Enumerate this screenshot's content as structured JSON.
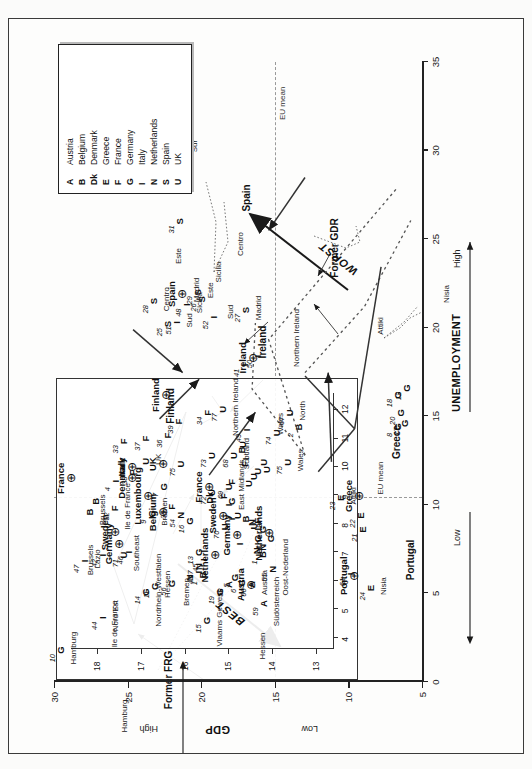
{
  "figure": {
    "title_hidden": "",
    "orientation": "rotated-90",
    "legend": {
      "name": "country-key",
      "entries": [
        {
          "key": "A",
          "label": "Austria"
        },
        {
          "key": "B",
          "label": "Belgium"
        },
        {
          "key": "Dk",
          "label": "Denmark"
        },
        {
          "key": "E",
          "label": "Greece"
        },
        {
          "key": "F",
          "label": "France"
        },
        {
          "key": "G",
          "label": "Germany"
        },
        {
          "key": "I",
          "label": "Italy"
        },
        {
          "key": "N",
          "label": "Netherlands"
        },
        {
          "key": "S",
          "label": "Spain"
        },
        {
          "key": "U",
          "label": "UK"
        }
      ]
    },
    "axes": {
      "x_title": "UNEMPLOYMENT",
      "x_low": "Low",
      "x_high": "High",
      "x_ticks": [
        "0",
        "5",
        "10",
        "15",
        "20",
        "25",
        "30",
        "35"
      ],
      "y_title": "GDP",
      "y_low": "Low",
      "y_high": "High",
      "y_ticks": [
        "5",
        "10",
        "15",
        "20",
        "25",
        "30"
      ],
      "eu_mean_label": "EU mean"
    },
    "annotations": {
      "best": "BEST",
      "worst": "WORST"
    },
    "inset": {
      "x_ticks": [
        "4",
        "5",
        "6",
        "7",
        "8",
        "9",
        "10",
        "11",
        "12"
      ],
      "y_ticks": [
        "13",
        "14",
        "15",
        "16",
        "17",
        "18"
      ]
    },
    "country_group_labels": [
      "Luxembourg",
      "Sweden",
      "Germany",
      "Austria",
      "Netherlands",
      "France",
      "Finland",
      "Greece",
      "Portugal",
      "Spain",
      "Ireland",
      "Former GDR",
      "Former FRG",
      "Denmark",
      "Belgium",
      "Italy",
      "UK"
    ],
    "region_labels": [
      "Hamburg",
      "Ile de France",
      "Brussels",
      "Bremen",
      "Hessen",
      "Wales",
      "Attiki",
      "Nisia",
      "Northern Ireland",
      "Sud",
      "Sicilia",
      "Centro",
      "Sur",
      "Este",
      "Madrid",
      "Nord Est",
      "Nordrhein-Westfalen",
      "Vlaams Gewest",
      "Oost-Nederland",
      "Südösterreich",
      "East Midlands",
      "Scotland",
      "Southeast",
      "England and Scotland",
      "North",
      "Lazio"
    ]
  },
  "chart_data": {
    "type": "scatter",
    "title": "",
    "xlabel": "UNEMPLOYMENT",
    "ylabel": "GDP",
    "xlim": [
      0,
      35
    ],
    "ylim": [
      5,
      30
    ],
    "grid": false,
    "legend_position": "top-right",
    "eu_mean_x": 10.4,
    "eu_mean_y": 15.0,
    "main_points": [
      {
        "key": "G",
        "id": "10",
        "x": 1.8,
        "y": 29.6,
        "region": "Hamburg"
      },
      {
        "key": "B",
        "id": "",
        "x": 9.6,
        "y": 27.6,
        "region": "Brussels"
      },
      {
        "key": "B",
        "id": "",
        "x": 10.2,
        "y": 27.2,
        "region": ""
      },
      {
        "key": "F",
        "id": "32",
        "x": 9.8,
        "y": 25.9,
        "region": "Ile de France"
      },
      {
        "key": "G",
        "id": "9",
        "x": 9.5,
        "y": 23.4,
        "region": "Bremen"
      },
      {
        "key": "G",
        "id": "11",
        "x": 5.4,
        "y": 23.2,
        "region": "Hessen"
      },
      {
        "key": "ctr",
        "id": "Luxembourg",
        "x": 10.5,
        "y": 23.6,
        "region": "Luxembourg"
      },
      {
        "key": "I",
        "id": "43",
        "x": 6.2,
        "y": 20.2,
        "region": ""
      },
      {
        "key": "I",
        "id": "45",
        "x": 6.9,
        "y": 19.9,
        "region": ""
      },
      {
        "key": "A",
        "id": "58",
        "x": 5.5,
        "y": 18.2,
        "region": ""
      },
      {
        "key": "G",
        "id": "5",
        "x": 5.9,
        "y": 17.8,
        "region": ""
      },
      {
        "key": "G",
        "id": "6",
        "x": 5.6,
        "y": 17.3,
        "region": ""
      },
      {
        "key": "A",
        "id": "60",
        "x": 5.5,
        "y": 16.6,
        "region": "Austria"
      },
      {
        "key": "I",
        "id": "",
        "x": 7.8,
        "y": 17.4,
        "region": ""
      },
      {
        "key": "N",
        "id": "",
        "x": 7.4,
        "y": 16.3,
        "region": ""
      },
      {
        "key": "B",
        "id": "1",
        "x": 7.2,
        "y": 15.9,
        "region": ""
      },
      {
        "key": "N",
        "id": "",
        "x": 7.6,
        "y": 15.9,
        "region": ""
      },
      {
        "key": "G",
        "id": "",
        "x": 8.1,
        "y": 16.2,
        "region": ""
      },
      {
        "key": "G",
        "id": "",
        "x": 8.6,
        "y": 15.9,
        "region": ""
      },
      {
        "key": "G",
        "id": "",
        "x": 8.1,
        "y": 15.3,
        "region": ""
      },
      {
        "key": "U",
        "id": "",
        "x": 8.8,
        "y": 16.5,
        "region": ""
      },
      {
        "key": "U",
        "id": "",
        "x": 9.4,
        "y": 17.6,
        "region": ""
      },
      {
        "key": "I",
        "id": "",
        "x": 9.2,
        "y": 18.0,
        "region": ""
      },
      {
        "key": "Dk",
        "id": "",
        "x": 10.4,
        "y": 19.5,
        "region": ""
      },
      {
        "key": "F",
        "id": "",
        "x": 10.5,
        "y": 18.5,
        "region": ""
      },
      {
        "key": "G",
        "id": "",
        "x": 10.2,
        "y": 18.0,
        "region": ""
      },
      {
        "key": "I",
        "id": "",
        "x": 10.0,
        "y": 18.2,
        "region": ""
      },
      {
        "key": "B",
        "id": "",
        "x": 9.2,
        "y": 17.0,
        "region": ""
      },
      {
        "key": "N",
        "id": "",
        "x": 9.0,
        "y": 16.6,
        "region": ""
      },
      {
        "key": "F",
        "id": "",
        "x": 9.1,
        "y": 16.2,
        "region": ""
      },
      {
        "key": "F",
        "id": "",
        "x": 11.3,
        "y": 18.0,
        "region": ""
      },
      {
        "key": "U",
        "id": "",
        "x": 11.2,
        "y": 16.8,
        "region": ""
      },
      {
        "key": "U",
        "id": "",
        "x": 11.6,
        "y": 16.5,
        "region": ""
      },
      {
        "key": "U",
        "id": "",
        "x": 11.9,
        "y": 16.2,
        "region": ""
      },
      {
        "key": "U",
        "id": "",
        "x": 12.0,
        "y": 15.6,
        "region": ""
      },
      {
        "key": "U",
        "id": "",
        "x": 12.4,
        "y": 15.8,
        "region": ""
      },
      {
        "key": "F",
        "id": "",
        "x": 12.3,
        "y": 17.1,
        "region": ""
      },
      {
        "key": "I",
        "id": "",
        "x": 12.6,
        "y": 17.0,
        "region": ""
      },
      {
        "key": "B",
        "id": "",
        "x": 13.1,
        "y": 17.3,
        "region": ""
      },
      {
        "key": "U",
        "id": "",
        "x": 13.4,
        "y": 17.2,
        "region": ""
      },
      {
        "key": "U",
        "id": "75",
        "x": 12.4,
        "y": 14.2,
        "region": "Wales"
      },
      {
        "key": "F",
        "id": "39",
        "x": 14.7,
        "y": 21.6,
        "region": ""
      },
      {
        "key": "F",
        "id": "34",
        "x": 15.2,
        "y": 19.6,
        "region": ""
      },
      {
        "key": "U",
        "id": "77",
        "x": 15.4,
        "y": 18.6,
        "region": "Northern Ireland"
      },
      {
        "key": "ctr",
        "id": "Finland",
        "x": 16.2,
        "y": 22.4,
        "region": "Finland"
      },
      {
        "key": "ctr",
        "id": "France",
        "x": 11.0,
        "y": 19.5,
        "region": "France"
      },
      {
        "key": "ctr",
        "id": "Sweden",
        "x": 9.4,
        "y": 18.5,
        "region": "Sweden"
      },
      {
        "key": "ctr",
        "id": "Germany",
        "x": 8.3,
        "y": 17.6,
        "region": "Germany"
      },
      {
        "key": "ctr",
        "id": "Austria",
        "x": 5.5,
        "y": 16.6,
        "region": "Austria"
      },
      {
        "key": "ctr",
        "id": "Netherlands",
        "x": 8.4,
        "y": 15.4,
        "region": "Netherlands"
      },
      {
        "key": "ctr",
        "id": "Ireland",
        "x": 18.3,
        "y": 16.5,
        "region": "Ireland"
      },
      {
        "key": "I",
        "id": "50",
        "x": 18.4,
        "y": 16.2,
        "region": ""
      },
      {
        "key": "I",
        "id": "41",
        "x": 17.9,
        "y": 17.1,
        "region": ""
      },
      {
        "key": "S",
        "id": "27",
        "x": 21.0,
        "y": 17.0,
        "region": "Madrid"
      },
      {
        "key": "S",
        "id": "26",
        "x": 21.6,
        "y": 20.0,
        "region": ""
      },
      {
        "key": "S",
        "id": "29",
        "x": 22.0,
        "y": 20.3,
        "region": "Este"
      },
      {
        "key": "I",
        "id": "52",
        "x": 20.6,
        "y": 19.2,
        "region": ""
      },
      {
        "key": "I",
        "id": "48",
        "x": 21.3,
        "y": 21.0,
        "region": "Sicilia"
      },
      {
        "key": "I",
        "id": "51",
        "x": 20.3,
        "y": 21.7,
        "region": "Sud"
      },
      {
        "key": "S",
        "id": "25",
        "x": 20.2,
        "y": 22.3,
        "region": ""
      },
      {
        "key": "S",
        "id": "28",
        "x": 21.5,
        "y": 23.3,
        "region": "Centro"
      },
      {
        "key": "S",
        "id": "31",
        "x": 26.0,
        "y": 21.5,
        "region": ""
      },
      {
        "key": "S",
        "id": "30",
        "x": 29.6,
        "y": 21.7,
        "region": "Sur"
      },
      {
        "key": "ctr",
        "id": "Spain",
        "x": 21.9,
        "y": 21.3,
        "region": "Spain"
      },
      {
        "key": "ctr",
        "id": "Greece",
        "x": 10.5,
        "y": 9.3,
        "region": "Greece"
      },
      {
        "key": "E",
        "id": "23",
        "x": 10.4,
        "y": 10.6,
        "region": "Attiki"
      },
      {
        "key": "E",
        "id": "22",
        "x": 9.4,
        "y": 9.2,
        "region": ""
      },
      {
        "key": "E",
        "id": "21",
        "x": 8.6,
        "y": 9.1,
        "region": ""
      },
      {
        "key": "E",
        "id": "24",
        "x": 5.3,
        "y": 8.5,
        "region": "Nisia"
      },
      {
        "key": "ctr",
        "id": "Portugal",
        "x": 6.0,
        "y": 9.6,
        "region": "Portugal"
      },
      {
        "key": "I",
        "id": "61",
        "x": 6.1,
        "y": 9.9,
        "region": ""
      },
      {
        "key": "G",
        "id": "18",
        "x": 16.2,
        "y": 6.7,
        "region": ""
      },
      {
        "key": "G",
        "id": "12",
        "x": 16.6,
        "y": 6.1,
        "region": ""
      },
      {
        "key": "G",
        "id": "20",
        "x": 15.2,
        "y": 6.5,
        "region": ""
      },
      {
        "key": "G",
        "id": "8",
        "x": 14.4,
        "y": 6.7,
        "region": ""
      },
      {
        "key": "G",
        "id": "17",
        "x": 14.6,
        "y": 6.2,
        "region": ""
      }
    ],
    "inset_points": [
      {
        "key": "I",
        "id": "44",
        "x": 4.7,
        "y": 17.9,
        "region": "Nord Est"
      },
      {
        "key": "I",
        "id": "42",
        "x": 6.9,
        "y": 17.9,
        "region": ""
      },
      {
        "key": "G",
        "id": "14",
        "x": 5.6,
        "y": 16.9,
        "region": "Nordrhein-Westfalen"
      },
      {
        "key": "G",
        "id": "56",
        "x": 5.9,
        "y": 16.3,
        "region": ""
      },
      {
        "key": "N",
        "id": "",
        "x": 6.1,
        "y": 15.9,
        "region": ""
      },
      {
        "key": "B",
        "id": "1",
        "x": 6.2,
        "y": 15.6,
        "region": ""
      },
      {
        "key": "N",
        "id": "57",
        "x": 6.5,
        "y": 15.7,
        "region": ""
      },
      {
        "key": "G",
        "id": "13",
        "x": 7.0,
        "y": 15.7,
        "region": ""
      },
      {
        "key": "G",
        "id": "15",
        "x": 4.6,
        "y": 15.5,
        "region": "Vlaams Gewest"
      },
      {
        "key": "G",
        "id": "19",
        "x": 5.6,
        "y": 15.2,
        "region": ""
      },
      {
        "key": "A",
        "id": "59",
        "x": 5.2,
        "y": 14.2,
        "region": "Südösterreich"
      },
      {
        "key": "N",
        "id": "55",
        "x": 6.4,
        "y": 14.0,
        "region": "Oost-Nederland"
      },
      {
        "key": "G",
        "id": "16",
        "x": 8.1,
        "y": 15.9,
        "region": ""
      },
      {
        "key": "N",
        "id": "54",
        "x": 8.3,
        "y": 16.1,
        "region": ""
      },
      {
        "key": "U",
        "id": "70",
        "x": 7.9,
        "y": 15.1,
        "region": ""
      },
      {
        "key": "U",
        "id": "72",
        "x": 9.1,
        "y": 15.4,
        "region": ""
      },
      {
        "key": "U",
        "id": "69",
        "x": 9.3,
        "y": 15.0,
        "region": "East Midlands"
      },
      {
        "key": "U",
        "id": "75",
        "x": 10.1,
        "y": 16.1,
        "region": ""
      },
      {
        "key": "U",
        "id": "73",
        "x": 10.4,
        "y": 15.4,
        "region": ""
      },
      {
        "key": "U",
        "id": "68",
        "x": 10.4,
        "y": 14.9,
        "region": "Scotland"
      },
      {
        "key": "U",
        "id": "",
        "x": 10.2,
        "y": 16.9,
        "region": "UK"
      },
      {
        "key": "G",
        "id": "7",
        "x": 9.3,
        "y": 16.5,
        "region": ""
      },
      {
        "key": "F",
        "id": "35",
        "x": 8.6,
        "y": 16.3,
        "region": ""
      },
      {
        "key": "F",
        "id": "33",
        "x": 10.9,
        "y": 17.4,
        "region": ""
      },
      {
        "key": "F",
        "id": "37",
        "x": 11.0,
        "y": 16.9,
        "region": ""
      },
      {
        "key": "F",
        "id": "36",
        "x": 11.1,
        "y": 16.4,
        "region": ""
      },
      {
        "key": "F",
        "id": "38",
        "x": 9.8,
        "y": 17.2,
        "region": ""
      },
      {
        "key": "I",
        "id": "47",
        "x": 6.7,
        "y": 18.3,
        "region": "Lazio"
      },
      {
        "key": "U",
        "id": "71",
        "x": 6.9,
        "y": 17.4,
        "region": "Southeast"
      },
      {
        "key": "U",
        "id": "67",
        "x": 11.9,
        "y": 13.6,
        "region": "North"
      },
      {
        "key": "I",
        "id": "49",
        "x": 11.3,
        "y": 14.6,
        "region": ""
      },
      {
        "key": "U",
        "id": "74",
        "x": 11.2,
        "y": 13.9,
        "region": ""
      },
      {
        "key": "B",
        "id": "2",
        "x": 11.4,
        "y": 13.4,
        "region": ""
      },
      {
        "key": "ctr",
        "id": "France",
        "x": 9.6,
        "y": 18.6,
        "region": "France"
      },
      {
        "key": "ctr",
        "id": "Sweden",
        "x": 7.7,
        "y": 17.6,
        "region": "Sweden"
      },
      {
        "key": "ctr",
        "id": "Denmark",
        "x": 9.6,
        "y": 17.2,
        "region": "Denmark"
      },
      {
        "key": "ctr",
        "id": "Italy",
        "x": 10.0,
        "y": 17.2,
        "region": "Italy"
      },
      {
        "key": "ctr",
        "id": "Belgium",
        "x": 8.4,
        "y": 16.5,
        "region": "Belgium"
      },
      {
        "key": "ctr",
        "id": "Germany",
        "x": 7.3,
        "y": 17.5,
        "region": "Germany"
      },
      {
        "key": "ctr",
        "id": "Netherlands",
        "x": 6.9,
        "y": 15.3,
        "region": "Netherlands"
      },
      {
        "key": "ctr",
        "id": "UK",
        "x": 10.1,
        "y": 16.5,
        "region": "UK"
      },
      {
        "key": "I",
        "id": "46",
        "x": 7.0,
        "y": 17.3,
        "region": ""
      },
      {
        "key": "I",
        "id": "4",
        "x": 9.5,
        "y": 17.6,
        "region": ""
      }
    ]
  }
}
